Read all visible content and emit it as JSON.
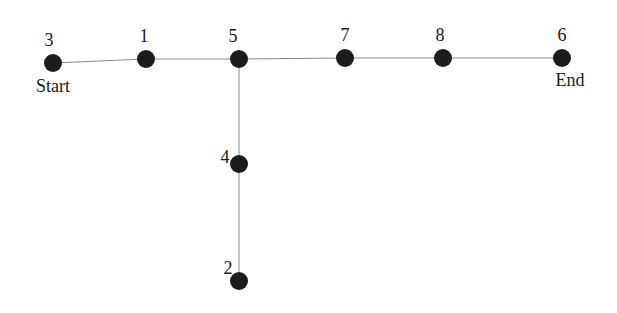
{
  "diagram": {
    "type": "graph",
    "node_radius": 9,
    "colors": {
      "node": "#1c1c1c",
      "edge": "#8a8a8a",
      "text": "#1a1a1a",
      "background": "#ffffff"
    },
    "nodes": [
      {
        "id": "3",
        "label": "3",
        "x": 53,
        "y": 63,
        "label_x": 49,
        "label_y": 46,
        "tag": "Start",
        "tag_x": 53,
        "tag_y": 92
      },
      {
        "id": "1",
        "label": "1",
        "x": 146,
        "y": 59,
        "label_x": 144,
        "label_y": 42
      },
      {
        "id": "5",
        "label": "5",
        "x": 239,
        "y": 59,
        "label_x": 233,
        "label_y": 42
      },
      {
        "id": "7",
        "label": "7",
        "x": 345,
        "y": 58,
        "label_x": 345,
        "label_y": 41
      },
      {
        "id": "8",
        "label": "8",
        "x": 443,
        "y": 58,
        "label_x": 440,
        "label_y": 41
      },
      {
        "id": "6",
        "label": "6",
        "x": 562,
        "y": 58,
        "label_x": 562,
        "label_y": 41,
        "tag": "End",
        "tag_x": 570,
        "tag_y": 86
      },
      {
        "id": "4",
        "label": "4",
        "x": 239,
        "y": 164,
        "label_x": 225,
        "label_y": 163
      },
      {
        "id": "2",
        "label": "2",
        "x": 239,
        "y": 281,
        "label_x": 228,
        "label_y": 274
      }
    ],
    "edges": [
      {
        "from": "3",
        "to": "1"
      },
      {
        "from": "1",
        "to": "5"
      },
      {
        "from": "5",
        "to": "7"
      },
      {
        "from": "7",
        "to": "8"
      },
      {
        "from": "8",
        "to": "6"
      },
      {
        "from": "5",
        "to": "4"
      },
      {
        "from": "4",
        "to": "2"
      }
    ]
  }
}
